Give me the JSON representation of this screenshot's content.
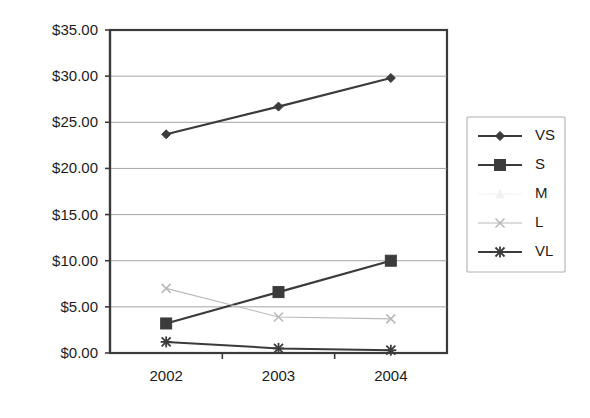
{
  "chart_data": {
    "type": "line",
    "title": "",
    "subtitle": "",
    "xlabel": "",
    "ylabel": "",
    "categories": [
      "2002",
      "2003",
      "2004"
    ],
    "x": [
      2002,
      2003,
      2004
    ],
    "ylim": [
      0,
      35
    ],
    "ytick_values": [
      0,
      5,
      10,
      15,
      20,
      25,
      30,
      35
    ],
    "ytick_labels": [
      "$0.00",
      "$5.00",
      "$10.00",
      "$15.00",
      "$20.00",
      "$25.00",
      "$30.00",
      "$35.00"
    ],
    "xtick_labels": [
      "2002",
      "2003",
      "2004"
    ],
    "grid": true,
    "grid_axis": "y",
    "legend_position": "right",
    "value_prefix": "$",
    "series": [
      {
        "name": "VS",
        "values": [
          23.7,
          26.7,
          29.8
        ],
        "marker": "diamond",
        "color": "#3b3b3b",
        "line_width": 2.2,
        "marker_size": 9
      },
      {
        "name": "S",
        "values": [
          3.2,
          6.6,
          10.0
        ],
        "marker": "square",
        "color": "#3b3b3b",
        "line_width": 2.2,
        "marker_size": 11
      },
      {
        "name": "M",
        "values": [
          null,
          null,
          null
        ],
        "marker": "triangle",
        "color": "#f2f2f2",
        "line_width": 1.0,
        "marker_size": 8
      },
      {
        "name": "L",
        "values": [
          7.0,
          3.9,
          3.7
        ],
        "marker": "cross-x",
        "color": "#b9b9b9",
        "line_width": 1.1,
        "marker_size": 9
      },
      {
        "name": "VL",
        "values": [
          1.2,
          0.5,
          0.3
        ],
        "marker": "asterisk",
        "color": "#3b3b3b",
        "line_width": 2.0,
        "marker_size": 9
      }
    ]
  },
  "legend": {
    "entries": [
      {
        "label": "VS"
      },
      {
        "label": "S"
      },
      {
        "label": "M"
      },
      {
        "label": "L"
      },
      {
        "label": "VL"
      }
    ]
  },
  "colors": {
    "background": "#ffffff",
    "plot_border": "#3a3a3a",
    "gridline": "#8d8d8d",
    "text": "#1c1c1c",
    "legend_border": "#b0b0b0",
    "dark_series": "#3b3b3b",
    "light_series": "#b9b9b9",
    "faint_series": "#f2f2f2"
  }
}
